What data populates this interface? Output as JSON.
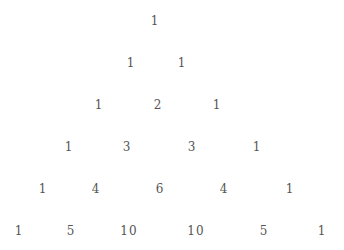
{
  "text_color": "#555555",
  "rows": [
    {
      "y": 21,
      "cells": [
        {
          "v": "1",
          "x": 155
        }
      ]
    },
    {
      "y": 63,
      "cells": [
        {
          "v": "1",
          "x": 131
        },
        {
          "v": "1",
          "x": 182
        }
      ]
    },
    {
      "y": 105,
      "cells": [
        {
          "v": "1",
          "x": 99
        },
        {
          "v": "2",
          "x": 158
        },
        {
          "v": "1",
          "x": 217
        }
      ]
    },
    {
      "y": 147,
      "cells": [
        {
          "v": "1",
          "x": 69
        },
        {
          "v": "3",
          "x": 127
        },
        {
          "v": "3",
          "x": 192
        },
        {
          "v": "1",
          "x": 257
        }
      ]
    },
    {
      "y": 189,
      "cells": [
        {
          "v": "1",
          "x": 43
        },
        {
          "v": "4",
          "x": 96
        },
        {
          "v": "6",
          "x": 160
        },
        {
          "v": "4",
          "x": 224
        },
        {
          "v": "1",
          "x": 290
        }
      ]
    },
    {
      "y": 231,
      "cells": [
        {
          "v": "1",
          "x": 19
        },
        {
          "v": "5",
          "x": 71
        },
        {
          "v": "10",
          "x": 129
        },
        {
          "v": "10",
          "x": 196
        },
        {
          "v": "5",
          "x": 264
        },
        {
          "v": "1",
          "x": 322
        }
      ]
    }
  ]
}
